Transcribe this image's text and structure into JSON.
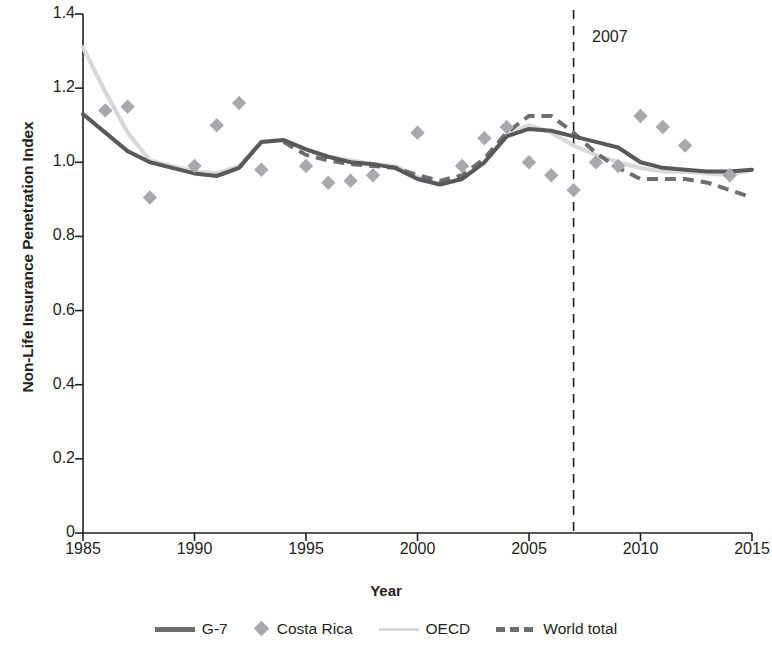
{
  "chart_data": {
    "type": "line",
    "title": "",
    "xlabel": "Year",
    "ylabel": "Non-Life Insurance Penetration Index",
    "xlim": [
      1985,
      2015
    ],
    "ylim": [
      0,
      1.4
    ],
    "xticks": [
      "1985",
      "1990",
      "1995",
      "2000",
      "2005",
      "2010",
      "2015"
    ],
    "yticks": [
      "1.4",
      "1.2",
      "1.0",
      "0.8",
      "0.6",
      "0.4",
      "0.2",
      "0"
    ],
    "grid": false,
    "legend_position": "bottom",
    "annotations": [
      {
        "label": "2007",
        "x": 2007,
        "type": "vertical-dashed-line"
      }
    ],
    "colors": {
      "g7": "#58595b",
      "costa_rica": "#a7a9ac",
      "oecd": "#d9d9d9",
      "world_total": "#6d6e71",
      "axis": "#231f20"
    },
    "series": [
      {
        "name": "G-7",
        "style": "solid",
        "color": "#58595b",
        "x": [
          1985,
          1986,
          1987,
          1988,
          1989,
          1990,
          1991,
          1992,
          1993,
          1994,
          1995,
          1996,
          1997,
          1998,
          1999,
          2000,
          2001,
          2002,
          2003,
          2004,
          2005,
          2006,
          2007,
          2008,
          2009,
          2010,
          2011,
          2012,
          2013,
          2014,
          2015
        ],
        "values": [
          1.13,
          1.08,
          1.03,
          1.0,
          0.985,
          0.97,
          0.963,
          0.985,
          1.055,
          1.06,
          1.035,
          1.015,
          1.0,
          0.995,
          0.985,
          0.955,
          0.94,
          0.955,
          1.0,
          1.07,
          1.09,
          1.085,
          1.07,
          1.055,
          1.04,
          1.0,
          0.985,
          0.98,
          0.975,
          0.975,
          0.98
        ]
      },
      {
        "name": "Costa Rica",
        "style": "markers",
        "marker": "diamond",
        "color": "#a7a9ac",
        "x": [
          1986,
          1987,
          1988,
          1990,
          1991,
          1992,
          1993,
          1995,
          1996,
          1997,
          1998,
          2000,
          2002,
          2003,
          2004,
          2005,
          2006,
          2007,
          2008,
          2009,
          2010,
          2011,
          2012,
          2014
        ],
        "values": [
          1.14,
          1.15,
          0.905,
          0.99,
          1.1,
          1.16,
          0.98,
          0.99,
          0.945,
          0.95,
          0.965,
          1.08,
          0.99,
          1.065,
          1.095,
          1.0,
          0.965,
          0.925,
          1.0,
          0.99,
          1.125,
          1.095,
          1.045,
          0.965
        ]
      },
      {
        "name": "OECD",
        "style": "solid-light",
        "color": "#d9d9d9",
        "x": [
          1985,
          1986,
          1987,
          1988,
          1989,
          1990,
          1991,
          1992,
          1993,
          1994,
          1995,
          1996,
          1997,
          1998,
          1999,
          2000,
          2001,
          2002,
          2003,
          2004,
          2005,
          2006,
          2007,
          2008,
          2009,
          2010,
          2011,
          2012,
          2013,
          2014,
          2015
        ],
        "values": [
          1.31,
          1.19,
          1.08,
          1.005,
          0.99,
          0.975,
          0.97,
          0.99,
          1.055,
          1.06,
          1.035,
          1.015,
          1.005,
          0.995,
          0.99,
          0.96,
          0.94,
          0.955,
          1.0,
          1.075,
          1.1,
          1.08,
          1.045,
          1.02,
          1.0,
          0.985,
          0.975,
          0.975,
          0.97,
          0.965,
          0.98
        ]
      },
      {
        "name": "World total",
        "style": "dashed",
        "color": "#6d6e71",
        "x": [
          1994,
          1995,
          1996,
          1997,
          1998,
          1999,
          2000,
          2001,
          2002,
          2003,
          2004,
          2005,
          2006,
          2007,
          2008,
          2009,
          2010,
          2011,
          2012,
          2013,
          2014,
          2015
        ],
        "values": [
          1.055,
          1.02,
          1.005,
          0.995,
          0.99,
          0.985,
          0.965,
          0.95,
          0.965,
          1.01,
          1.08,
          1.125,
          1.125,
          1.08,
          1.025,
          0.985,
          0.955,
          0.955,
          0.955,
          0.945,
          0.925,
          0.905
        ]
      }
    ]
  },
  "axis_titles": {
    "y": "Non-Life Insurance Penetration Index",
    "x": "Year"
  },
  "annotation": {
    "year_label": "2007"
  },
  "legend": {
    "items": [
      {
        "label": "G-7",
        "swatch": "solid-line-swatch"
      },
      {
        "label": "Costa Rica",
        "swatch": "diamond-marker-swatch"
      },
      {
        "label": "OECD",
        "swatch": "light-line-swatch"
      },
      {
        "label": "World total",
        "swatch": "dashed-line-swatch"
      }
    ]
  }
}
